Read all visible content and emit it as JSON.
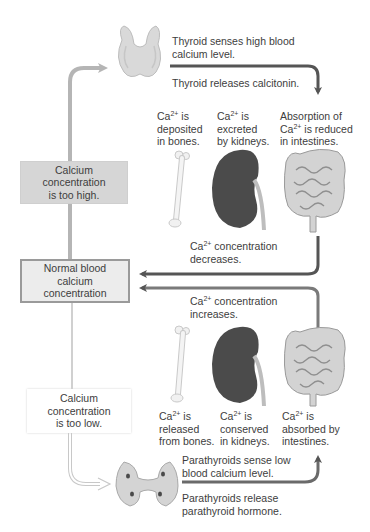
{
  "diagram": {
    "center": {
      "label": "Normal blood calcium concentration",
      "lines": [
        "Normal blood",
        "calcium",
        "concentration"
      ]
    },
    "high_path": {
      "condition": {
        "lines": [
          "Calcium",
          "concentration",
          "is too high."
        ]
      },
      "sensor_text": {
        "lines": [
          "Thyroid senses high blood",
          "calcium level."
        ]
      },
      "response_text": "Thyroid releases calcitonin.",
      "effects": [
        {
          "ion": "Ca",
          "charge": "2+",
          "rest1": " is",
          "line2": "deposited",
          "line3": "in bones."
        },
        {
          "ion": "Ca",
          "charge": "2+",
          "rest1": " is",
          "line2": "excreted",
          "line3": "by kidneys."
        },
        {
          "pre": "Absorption of",
          "ion": "Ca",
          "charge": "2+",
          "rest1": " is reduced",
          "line3": "in intestines."
        }
      ],
      "result": {
        "ion": "Ca",
        "charge": "2+",
        "line1_rest": " concentration",
        "line2": "decreases."
      }
    },
    "low_path": {
      "condition": {
        "lines": [
          "Calcium",
          "concentration",
          "is too low."
        ]
      },
      "sensor_text": {
        "lines": [
          "Parathyroids sense low",
          "blood calcium level."
        ]
      },
      "response_text": {
        "lines": [
          "Parathyroids release",
          "parathyroid hormone."
        ]
      },
      "effects": [
        {
          "ion": "Ca",
          "charge": "2+",
          "rest1": " is",
          "line2": "released",
          "line3": "from bones."
        },
        {
          "ion": "Ca",
          "charge": "2+",
          "rest1": " is",
          "line2": "conserved",
          "line3": "in kidneys."
        },
        {
          "ion": "Ca",
          "charge": "2+",
          "rest1": " is",
          "line2": "absorbed by",
          "line3": "intestines."
        }
      ],
      "result": {
        "ion": "Ca",
        "charge": "2+",
        "line1_rest": " concentration",
        "line2": "increases."
      }
    },
    "icons": [
      "thyroid-gland-icon",
      "bone-icon",
      "kidney-icon",
      "intestines-icon",
      "parathyroid-glands-icon"
    ],
    "colors": {
      "dark_arrow": "#555555",
      "light_arrow": "#b5b5b5",
      "outline_arrow": "#c8c8c8",
      "high_box_fill": "#d6d6d6",
      "normal_box_fill": "#ececec",
      "normal_box_border": "#9a9a9a",
      "kidney": "#4a4a4a",
      "gland": "#cfcfcf"
    }
  }
}
